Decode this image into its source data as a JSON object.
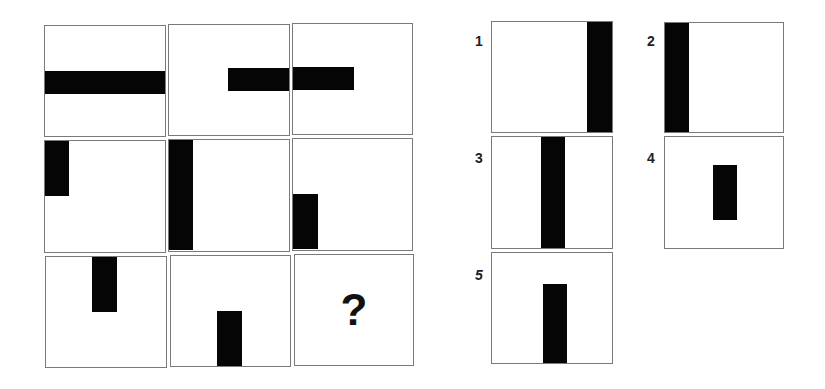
{
  "puzzle": {
    "type": "3x3 matrix reasoning",
    "missing_marker": "?",
    "bar_color": "#050505",
    "border_color": "#7a7a7a",
    "grid": [
      {
        "row": 0,
        "col": 0,
        "bar": "horizontal full-width, vertically centered"
      },
      {
        "row": 0,
        "col": 1,
        "bar": "horizontal half-width, right side, centered"
      },
      {
        "row": 0,
        "col": 2,
        "bar": "horizontal half-width, left side, centered"
      },
      {
        "row": 1,
        "col": 0,
        "bar": "vertical half-height, left edge, top"
      },
      {
        "row": 1,
        "col": 1,
        "bar": "vertical full-height, left edge"
      },
      {
        "row": 1,
        "col": 2,
        "bar": "vertical half-height, left edge, bottom"
      },
      {
        "row": 2,
        "col": 0,
        "bar": "vertical half-height, center, top"
      },
      {
        "row": 2,
        "col": 1,
        "bar": "vertical half-height, center, bottom"
      },
      {
        "row": 2,
        "col": 2,
        "bar": "missing",
        "label": "?"
      }
    ],
    "options": [
      {
        "label": "1",
        "bar": "vertical full-height, right edge"
      },
      {
        "label": "2",
        "bar": "vertical full-height, left edge"
      },
      {
        "label": "3",
        "bar": "vertical full-height, center"
      },
      {
        "label": "4",
        "bar": "vertical half-height, center, middle"
      },
      {
        "label": "5",
        "bar": "vertical partial-height, center, bottom"
      }
    ]
  }
}
